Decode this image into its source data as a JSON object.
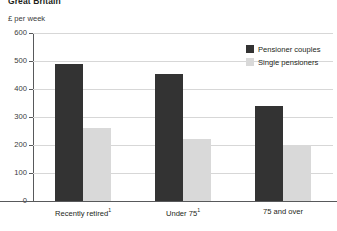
{
  "header": {
    "title": "Great Britain",
    "axis_unit": "£ per week"
  },
  "legend": {
    "position": "top-right",
    "items": [
      {
        "label": "Pensioner couples",
        "color": "#333333",
        "swatch": "dark-swatch"
      },
      {
        "label": "Single pensioners",
        "color": "#d9d9d9",
        "swatch": "light-swatch"
      }
    ]
  },
  "axis": {
    "y_ticks": [
      "600",
      "500",
      "400",
      "300",
      "200",
      "100",
      "0"
    ],
    "x_labels": [
      {
        "text": "Recently retired",
        "footnote": "1"
      },
      {
        "text": "Under 75",
        "footnote": "1"
      },
      {
        "text": "75 and over",
        "footnote": ""
      }
    ]
  },
  "chart_data": {
    "type": "bar",
    "title": "Great Britain",
    "subtitle": "",
    "xlabel": "",
    "ylabel": "£ per week",
    "ylim": [
      0,
      600
    ],
    "ytick_step": 100,
    "grid": true,
    "legend_position": "top-right",
    "categories": [
      "Recently retired",
      "Under 75",
      "75 and over"
    ],
    "series": [
      {
        "name": "Pensioner couples",
        "color": "#333333",
        "values": [
          490,
          455,
          340
        ]
      },
      {
        "name": "Single pensioners",
        "color": "#d9d9d9",
        "values": [
          260,
          220,
          200
        ]
      }
    ]
  }
}
